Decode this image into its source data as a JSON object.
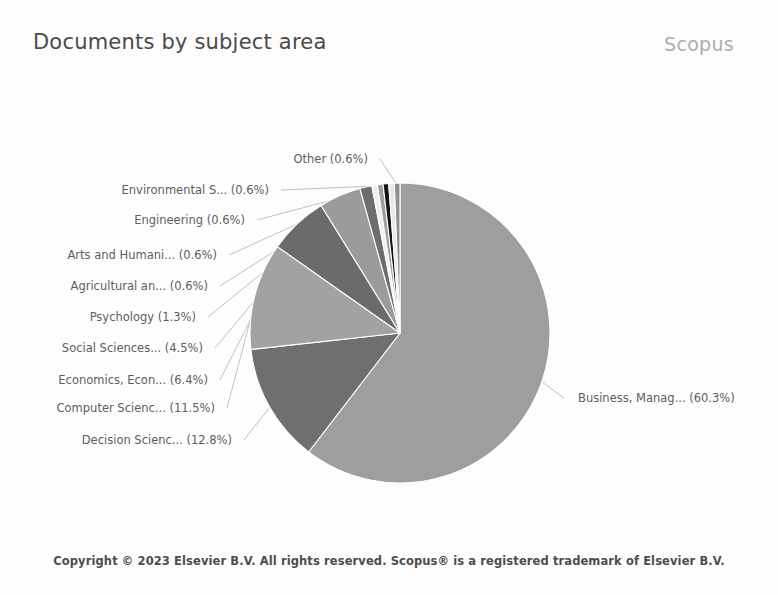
{
  "header": {
    "title": "Documents by subject area",
    "brand": "Scopus"
  },
  "footer": {
    "copyright": "Copyright © 2023 Elsevier B.V. All rights reserved. Scopus® is a registered trademark of Elsevier B.V."
  },
  "chart_data": {
    "type": "pie",
    "title": "Documents by subject area",
    "xlabel": "",
    "ylabel": "",
    "legend_position": "none",
    "label_format": "{name} ({value}%)",
    "start_angle_deg": -90,
    "direction": "clockwise",
    "categories": [
      "Business, Manag...",
      "Decision Scienc...",
      "Computer Scienc...",
      "Economics, Econ...",
      "Social Sciences...",
      "Psychology",
      "Agricultural an...",
      "Arts and Humani...",
      "Engineering",
      "Environmental S...",
      "Other"
    ],
    "values": [
      60.3,
      12.8,
      11.5,
      6.4,
      4.5,
      1.3,
      0.6,
      0.6,
      0.6,
      0.6,
      0.6
    ],
    "colors": [
      "#9e9e9e",
      "#6f6f6f",
      "#a2a2a2",
      "#6b6b6b",
      "#9b9b9b",
      "#6d6d6d",
      "#f0f0f0",
      "#9f9f9f",
      "#151515",
      "#e9e9e9",
      "#8f8f8f"
    ],
    "labels": [
      {
        "name": "Business, Manag...",
        "value": 60.3,
        "text": "Business, Manag... (60.3%)",
        "side": "right",
        "lx": 578,
        "ly": 303
      },
      {
        "name": "Decision Scienc...",
        "value": 12.8,
        "text": "Decision Scienc... (12.8%)",
        "side": "left",
        "lx": 232,
        "ly": 345
      },
      {
        "name": "Computer Scienc...",
        "value": 11.5,
        "text": "Computer Scienc... (11.5%)",
        "side": "left",
        "lx": 215,
        "ly": 313
      },
      {
        "name": "Economics, Econ...",
        "value": 6.4,
        "text": "Economics, Econ... (6.4%)",
        "side": "left",
        "lx": 208,
        "ly": 285
      },
      {
        "name": "Social Sciences...",
        "value": 4.5,
        "text": "Social Sciences... (4.5%)",
        "side": "left",
        "lx": 203,
        "ly": 253
      },
      {
        "name": "Psychology",
        "value": 1.3,
        "text": "Psychology (1.3%)",
        "side": "left",
        "lx": 196,
        "ly": 222
      },
      {
        "name": "Agricultural an...",
        "value": 0.6,
        "text": "Agricultural an... (0.6%)",
        "side": "left",
        "lx": 208,
        "ly": 191
      },
      {
        "name": "Arts and Humani...",
        "value": 0.6,
        "text": "Arts and Humani... (0.6%)",
        "side": "left",
        "lx": 217,
        "ly": 160
      },
      {
        "name": "Engineering",
        "value": 0.6,
        "text": "Engineering (0.6%)",
        "side": "left",
        "lx": 245,
        "ly": 125
      },
      {
        "name": "Environmental S...",
        "value": 0.6,
        "text": "Environmental S... (0.6%)",
        "side": "left",
        "lx": 269,
        "ly": 95
      },
      {
        "name": "Other",
        "value": 0.6,
        "text": "Other (0.6%)",
        "side": "left",
        "lx": 368,
        "ly": 64
      }
    ],
    "geometry": {
      "cx": 400,
      "cy": 238,
      "r": 150
    }
  }
}
